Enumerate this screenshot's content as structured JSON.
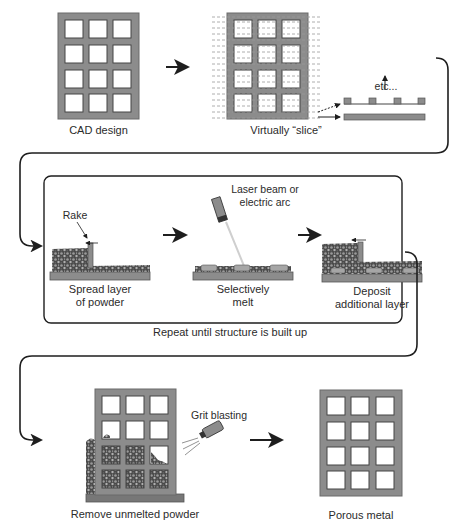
{
  "colors": {
    "metal": "#8c8c8c",
    "metal_edge": "#555555",
    "powder": "#3d3d3d",
    "line": "#1e1e1e",
    "beam": "#cfcfcf"
  },
  "stages": {
    "cad": {
      "label": "CAD design"
    },
    "slice": {
      "label": "Virtually “slice”",
      "etc": "etc..."
    },
    "process_box": {
      "spread": {
        "label_line1": "Spread layer",
        "label_line2": "of powder",
        "rake": "Rake"
      },
      "melt": {
        "label_line1": "Selectively",
        "label_line2": "melt",
        "source_line1": "Laser beam or",
        "source_line2": "electric arc"
      },
      "deposit": {
        "label_line1": "Deposit",
        "label_line2": "additional layer"
      },
      "repeat": "Repeat until structure is built up"
    },
    "remove": {
      "label": "Remove unmelted powder",
      "tool": "Grit blasting"
    },
    "final": {
      "label": "Porous metal"
    }
  },
  "flow": [
    "CAD design",
    "Virtually slice",
    "Spread layer of powder",
    "Selectively melt",
    "Deposit additional layer",
    "Repeat until structure is built up",
    "Remove unmelted powder",
    "Porous metal"
  ]
}
